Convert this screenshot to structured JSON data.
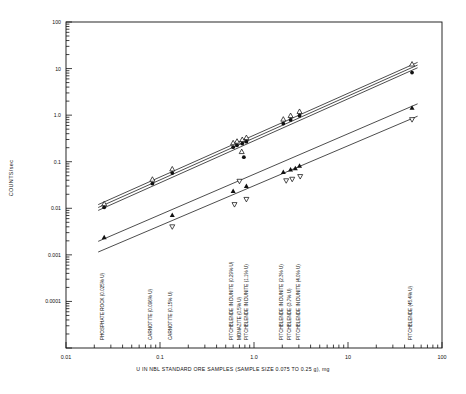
{
  "chart_data": {
    "type": "scatter",
    "title": "",
    "xlabel": "U IN NBL STANDARD ORE SAMPLES (SAMPLE SIZE 0.075 TO 0.25 g), mg",
    "ylabel": "COUNTS/sec",
    "xscale": "log",
    "yscale": "log",
    "xlim": [
      0.01,
      100
    ],
    "ylim": [
      1e-05,
      100
    ],
    "grid": false,
    "legend": "none",
    "xticks": [
      "0.01",
      "0.1",
      "1.0",
      "10",
      "100"
    ],
    "xtick_values": [
      0.01,
      0.1,
      1.0,
      10,
      100
    ],
    "yticks": [
      "100",
      "10",
      "1.0",
      "0.1",
      "0.01",
      "0.001",
      "0.0001"
    ],
    "ytick_values": [
      100,
      10,
      1.0,
      0.1,
      0.01,
      0.001,
      0.0001
    ],
    "series": [
      {
        "name": "upper-open-triangle",
        "marker": "open-triangle-up",
        "points": [
          {
            "x": 0.0255,
            "y": 0.0125
          },
          {
            "x": 0.083,
            "y": 0.042
          },
          {
            "x": 0.135,
            "y": 0.07
          },
          {
            "x": 0.6,
            "y": 0.255
          },
          {
            "x": 0.66,
            "y": 0.275
          },
          {
            "x": 0.75,
            "y": 0.3
          },
          {
            "x": 0.83,
            "y": 0.33
          },
          {
            "x": 2.05,
            "y": 0.82
          },
          {
            "x": 2.45,
            "y": 0.98
          },
          {
            "x": 3.05,
            "y": 1.2
          },
          {
            "x": 48.0,
            "y": 12.5
          }
        ]
      },
      {
        "name": "upper-filled-circle",
        "marker": "filled-circle",
        "points": [
          {
            "x": 0.0255,
            "y": 0.0105
          },
          {
            "x": 0.083,
            "y": 0.034
          },
          {
            "x": 0.135,
            "y": 0.057
          },
          {
            "x": 0.6,
            "y": 0.205
          },
          {
            "x": 0.66,
            "y": 0.225
          },
          {
            "x": 0.75,
            "y": 0.245
          },
          {
            "x": 0.83,
            "y": 0.27
          },
          {
            "x": 2.05,
            "y": 0.66
          },
          {
            "x": 2.45,
            "y": 0.79
          },
          {
            "x": 3.05,
            "y": 0.97
          },
          {
            "x": 48.0,
            "y": 8.2
          }
        ]
      },
      {
        "name": "outlier-low-filled-circle",
        "marker": "filled-circle",
        "points": [
          {
            "x": 0.78,
            "y": 0.125
          }
        ]
      },
      {
        "name": "outlier-open-triangle",
        "marker": "open-triangle-up",
        "points": [
          {
            "x": 0.74,
            "y": 0.165
          }
        ]
      },
      {
        "name": "middle-filled-triangle",
        "marker": "filled-triangle-up",
        "points": [
          {
            "x": 0.0255,
            "y": 0.0024
          },
          {
            "x": 0.135,
            "y": 0.0072
          },
          {
            "x": 0.6,
            "y": 0.0235
          },
          {
            "x": 0.83,
            "y": 0.03
          },
          {
            "x": 2.05,
            "y": 0.06
          },
          {
            "x": 2.45,
            "y": 0.068
          },
          {
            "x": 2.75,
            "y": 0.072
          },
          {
            "x": 3.05,
            "y": 0.082
          },
          {
            "x": 48.0,
            "y": 1.45
          }
        ]
      },
      {
        "name": "lower-open-triangle-down",
        "marker": "open-triangle-down",
        "points": [
          {
            "x": 0.135,
            "y": 0.004
          },
          {
            "x": 0.62,
            "y": 0.012
          },
          {
            "x": 0.7,
            "y": 0.038
          },
          {
            "x": 0.83,
            "y": 0.0155
          },
          {
            "x": 2.2,
            "y": 0.039
          },
          {
            "x": 2.55,
            "y": 0.042
          },
          {
            "x": 3.1,
            "y": 0.048
          },
          {
            "x": 48.0,
            "y": 0.8
          }
        ]
      }
    ],
    "fit_lines": [
      {
        "name": "fit-upper-a",
        "x1": 0.022,
        "y1": 0.012,
        "x2": 55.0,
        "y2": 13.6
      },
      {
        "name": "fit-upper-b",
        "x1": 0.022,
        "y1": 0.0104,
        "x2": 55.0,
        "y2": 11.9
      },
      {
        "name": "fit-upper-c",
        "x1": 0.022,
        "y1": 0.009,
        "x2": 55.0,
        "y2": 10.4
      },
      {
        "name": "fit-middle",
        "x1": 0.022,
        "y1": 0.00195,
        "x2": 55.0,
        "y2": 1.75
      },
      {
        "name": "fit-lower",
        "x1": 0.022,
        "y1": 0.00115,
        "x2": 55.0,
        "y2": 0.95
      }
    ],
    "sample_labels": [
      {
        "text": "PHOSPHATE ROCK (0.025% U)",
        "x": 0.0255
      },
      {
        "text": "CARNOTITE (0.096% U)",
        "x": 0.083
      },
      {
        "text": "CARNOTITE (0.15% U)",
        "x": 0.135
      },
      {
        "text": "PITCHBLENDE IN DUNITE (0.29% U)",
        "x": 0.6
      },
      {
        "text": "MONAZITE (0.5% U)",
        "x": 0.72
      },
      {
        "text": "PITCHBLENDE IN DUNITE (1.1% U)",
        "x": 0.86
      },
      {
        "text": "PITCHBLENDE IN DUNITE (2.3% U)",
        "x": 2.05
      },
      {
        "text": "PITCHBLENDE (3.7% U)",
        "x": 2.45
      },
      {
        "text": "PITCHBLENDE IN DUNITE (4.0% U)",
        "x": 3.05
      },
      {
        "text": "PITCHBLENDE (45.4% U)",
        "x": 48.0
      }
    ]
  }
}
